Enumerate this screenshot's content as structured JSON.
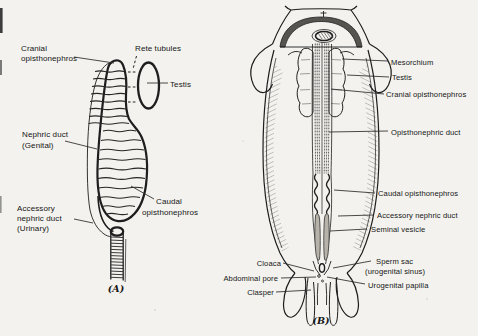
{
  "colors": {
    "paper": "#f3f2ee",
    "ink": "#1e1e1e",
    "dome_fill": "#56544f"
  },
  "figure_a": {
    "caption": "(A)",
    "labels": {
      "cranial_l1": "Cranial",
      "cranial_l2": "opisthonephros",
      "rete_tubules": "Rete tubules",
      "testis": "Testis",
      "nephric_l1": "Nephric duct",
      "nephric_l2": "(Genital)",
      "accessory_l1": "Accessory",
      "accessory_l2": "nephric duct",
      "accessory_l3": "(Urinary)",
      "caudal_l1": "Caudal",
      "caudal_l2": "opisthonephros"
    }
  },
  "figure_b": {
    "caption": "(B)",
    "labels": {
      "mesorchium": "Mesorchium",
      "testis": "Testis",
      "cranial_opisthonephros": "Cranial opisthonephros",
      "opisthonephric_duct": "Opisthonephric duct",
      "caudal_opisthonephros": "Caudal opisthonephros",
      "accessory_nephric_duct": "Accessory nephric duct",
      "seminal_vesicle": "Seminal vesicle",
      "sperm_sac_l1": "Sperm sac",
      "sperm_sac_l2": "(urogenital sinus)",
      "urogenital_papilla": "Urogenital papilla",
      "cloaca": "Cloaca",
      "abdominal_pore": "Abdominal pore",
      "clasper": "Clasper"
    }
  }
}
